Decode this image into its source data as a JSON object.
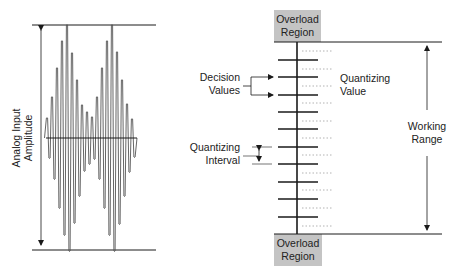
{
  "labels": {
    "y_axis_line1": "Analog Input",
    "y_axis_line2": "Amplitude",
    "overload_top_line1": "Overload",
    "overload_top_line2": "Region",
    "overload_bottom_line1": "Overload",
    "overload_bottom_line2": "Region",
    "decision_line1": "Decision",
    "decision_line2": "Values",
    "quantizing_value_line1": "Quantizing",
    "quantizing_value_line2": "Value",
    "quantizing_interval_line1": "Quantizing",
    "quantizing_interval_line2": "Interval",
    "working_line1": "Working",
    "working_line2": "Range"
  },
  "colors": {
    "line": "#1a1a1a",
    "waveform": "#555555",
    "overload_fill": "#c4c4c4",
    "dotted": "#a0a0a0"
  },
  "waveform": {
    "baseline_y": 138,
    "top_y": 25,
    "bottom_y": 250,
    "peaks_x": [
      47,
      52,
      57,
      62,
      67,
      72,
      77,
      82,
      87,
      92,
      97,
      102,
      107,
      112,
      117,
      122,
      127,
      132
    ],
    "peaks_top_y": [
      118,
      97,
      68,
      41,
      25,
      53,
      80,
      105,
      112,
      117,
      97,
      68,
      41,
      25,
      52,
      80,
      104,
      119
    ]
  },
  "quantizer": {
    "axis_x": 297,
    "top_y": 42,
    "bottom_y": 234,
    "tick_y": [
      60,
      77,
      95,
      112,
      129,
      147,
      164,
      182,
      199,
      217
    ],
    "dotted_y": [
      51,
      69,
      86,
      103,
      121,
      138,
      155,
      173,
      190,
      208,
      226
    ]
  }
}
